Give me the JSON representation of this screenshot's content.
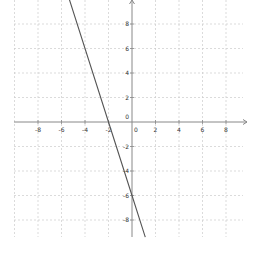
{
  "chart_data": {
    "type": "line",
    "title": "",
    "xlabel": "",
    "ylabel": "",
    "xlim": [
      -10,
      9.7
    ],
    "ylim": [
      -9.4,
      10
    ],
    "grid": true,
    "grid_step": 2,
    "x_ticks": [
      -8,
      -6,
      -4,
      -2,
      0,
      2,
      4,
      6,
      8
    ],
    "y_ticks": [
      8,
      6,
      4,
      2,
      0,
      -2,
      -4,
      -6,
      -8
    ],
    "x_tick_labels": [
      "-8",
      "-6",
      "-4",
      "-2",
      "0",
      "2",
      "4",
      "6",
      "8"
    ],
    "y_tick_labels": [
      "8",
      "6",
      "4",
      "2",
      "0",
      "-2",
      "-4",
      "-6",
      "-8"
    ],
    "series": [
      {
        "name": "y = -3x - 6",
        "equation": "y = -3x - 6",
        "slope": -3,
        "intercept": -6,
        "x": [
          -5.33,
          -2,
          0,
          1.13
        ],
        "y": [
          10,
          0,
          -6,
          -9.4
        ],
        "color": "#555555"
      }
    ],
    "legend": null
  },
  "style": {
    "axis_color": "#888888",
    "grid_color": "#cccccc",
    "line_color": "#555555",
    "label_color": "#333333"
  },
  "layout": {
    "origin_px": [
      132,
      122
    ],
    "px_per_x_unit": 11.75,
    "px_per_y_unit": 12.25,
    "x_axis_px_range": [
      14,
      247
    ],
    "y_axis_px_range": [
      0,
      237
    ]
  }
}
